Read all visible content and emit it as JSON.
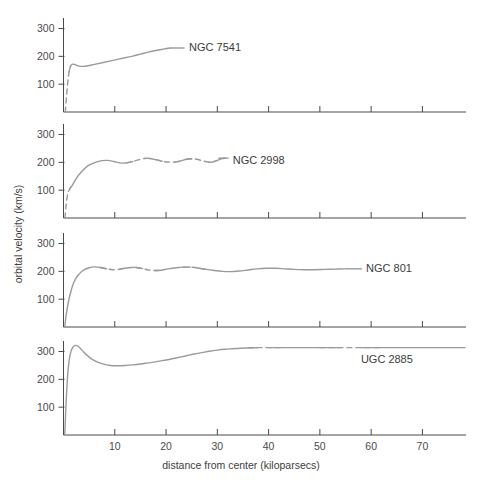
{
  "chart_data": {
    "type": "line",
    "title": "",
    "subtitle": "",
    "xlabel": "distance from center (kiloparsecs)",
    "ylabel": "orbital velocity (km/s)",
    "xlim": [
      0,
      78.5
    ],
    "ylim": [
      0,
      345
    ],
    "xticks": [
      10,
      20,
      30,
      40,
      50,
      60,
      70
    ],
    "xtick_labels": [
      "10",
      "20",
      "30",
      "40",
      "50",
      "60",
      "70"
    ],
    "yticks": [
      100,
      200,
      300
    ],
    "ytick_labels": [
      "100",
      "200",
      "300"
    ],
    "grid": false,
    "legend_position": "inline-right-of-curve",
    "panels": [
      {
        "name": "NGC 7541",
        "label": "NGC 7541",
        "label_x": 24.5,
        "label_y": 232,
        "leader_from_x": 21.0,
        "leader_to_x": 23.6,
        "points": [
          [
            0.35,
            0
          ],
          [
            0.6,
            60
          ],
          [
            0.85,
            110
          ],
          [
            1.1,
            145
          ],
          [
            1.4,
            166
          ],
          [
            1.8,
            172
          ],
          [
            2.3,
            170
          ],
          [
            3.0,
            165
          ],
          [
            3.8,
            164
          ],
          [
            4.8,
            166
          ],
          [
            6.0,
            171
          ],
          [
            7.5,
            177
          ],
          [
            9.0,
            183
          ],
          [
            10.5,
            189
          ],
          [
            12.0,
            195
          ],
          [
            13.5,
            201
          ],
          [
            15.0,
            208
          ],
          [
            16.5,
            215
          ],
          [
            18.0,
            221
          ],
          [
            19.5,
            226
          ],
          [
            20.5,
            229
          ],
          [
            21.0,
            230
          ]
        ],
        "dashed_ranges": [
          [
            0.35,
            1.35
          ]
        ]
      },
      {
        "name": "NGC 2998",
        "label": "NGC 2998",
        "label_x": 33.0,
        "label_y": 207,
        "leader_from_x": 30.2,
        "leader_to_x": 32.2,
        "points": [
          [
            0.3,
            0
          ],
          [
            0.5,
            45
          ],
          [
            0.8,
            85
          ],
          [
            1.2,
            104
          ],
          [
            1.8,
            120
          ],
          [
            2.6,
            145
          ],
          [
            3.6,
            168
          ],
          [
            4.8,
            188
          ],
          [
            6.2,
            200
          ],
          [
            7.5,
            206
          ],
          [
            8.6,
            207
          ],
          [
            9.8,
            203
          ],
          [
            11.0,
            198
          ],
          [
            12.2,
            198
          ],
          [
            13.5,
            203
          ],
          [
            14.8,
            210
          ],
          [
            15.8,
            214
          ],
          [
            16.8,
            214
          ],
          [
            18.0,
            210
          ],
          [
            19.2,
            204
          ],
          [
            20.4,
            201
          ],
          [
            21.6,
            201
          ],
          [
            22.8,
            205
          ],
          [
            24.0,
            211
          ],
          [
            25.0,
            213
          ],
          [
            26.0,
            211
          ],
          [
            27.2,
            205
          ],
          [
            28.2,
            201
          ],
          [
            29.0,
            201
          ],
          [
            30.0,
            207
          ],
          [
            30.8,
            213
          ],
          [
            31.6,
            215
          ]
        ],
        "dashed_ranges": [
          [
            0.3,
            1.3
          ],
          [
            13.3,
            16.2
          ],
          [
            18.4,
            22.2
          ],
          [
            24.6,
            28.8
          ]
        ]
      },
      {
        "name": "NGC 801",
        "label": "NGC 801",
        "label_x": 59.0,
        "label_y": 213,
        "leader_from_x": 56.0,
        "leader_to_x": 58.2,
        "points": [
          [
            0.25,
            0
          ],
          [
            0.5,
            40
          ],
          [
            0.9,
            85
          ],
          [
            1.4,
            125
          ],
          [
            2.0,
            160
          ],
          [
            2.8,
            185
          ],
          [
            3.8,
            203
          ],
          [
            5.0,
            213
          ],
          [
            6.0,
            216
          ],
          [
            7.2,
            214
          ],
          [
            8.4,
            209
          ],
          [
            9.6,
            206
          ],
          [
            10.8,
            207
          ],
          [
            12.0,
            211
          ],
          [
            13.2,
            214
          ],
          [
            14.2,
            214
          ],
          [
            15.4,
            210
          ],
          [
            16.6,
            205
          ],
          [
            17.8,
            203
          ],
          [
            19.0,
            204
          ],
          [
            20.4,
            209
          ],
          [
            22.0,
            213
          ],
          [
            23.4,
            215
          ],
          [
            24.8,
            215
          ],
          [
            26.2,
            212
          ],
          [
            27.8,
            207
          ],
          [
            29.4,
            203
          ],
          [
            31.0,
            200
          ],
          [
            32.6,
            199
          ],
          [
            34.2,
            201
          ],
          [
            36.0,
            205
          ],
          [
            37.8,
            209
          ],
          [
            39.6,
            211
          ],
          [
            41.4,
            211
          ],
          [
            43.2,
            209
          ],
          [
            45.0,
            207
          ],
          [
            47.0,
            206
          ],
          [
            49.0,
            206
          ],
          [
            51.0,
            207
          ],
          [
            53.0,
            208
          ],
          [
            55.0,
            209
          ],
          [
            56.0,
            209
          ]
        ],
        "dashed_ranges": [
          [
            8.0,
            11.0
          ],
          [
            15.0,
            18.6
          ],
          [
            24.2,
            27.2
          ]
        ]
      },
      {
        "name": "UGC 2885",
        "label": "UGC 2885",
        "label_x": 58.0,
        "label_y": 272,
        "leader_from_x": null,
        "leader_to_x": null,
        "points": [
          [
            0.25,
            0
          ],
          [
            0.4,
            70
          ],
          [
            0.6,
            150
          ],
          [
            0.9,
            235
          ],
          [
            1.3,
            290
          ],
          [
            1.8,
            315
          ],
          [
            2.3,
            322
          ],
          [
            2.9,
            318
          ],
          [
            3.6,
            305
          ],
          [
            4.5,
            288
          ],
          [
            5.6,
            272
          ],
          [
            6.8,
            261
          ],
          [
            8.0,
            254
          ],
          [
            9.2,
            250
          ],
          [
            10.5,
            249
          ],
          [
            12.0,
            250
          ],
          [
            13.5,
            252
          ],
          [
            15.0,
            255
          ],
          [
            16.5,
            259
          ],
          [
            18.0,
            263
          ],
          [
            19.5,
            268
          ],
          [
            21.0,
            273
          ],
          [
            22.5,
            279
          ],
          [
            24.0,
            285
          ],
          [
            25.5,
            291
          ],
          [
            27.0,
            296
          ],
          [
            28.5,
            301
          ],
          [
            30.0,
            305
          ],
          [
            31.5,
            308
          ],
          [
            33.0,
            310
          ],
          [
            34.5,
            312
          ],
          [
            36.0,
            313
          ],
          [
            38.0,
            314
          ],
          [
            40.0,
            314
          ],
          [
            43.0,
            314
          ],
          [
            46.0,
            314
          ],
          [
            50.0,
            314
          ],
          [
            54.0,
            314
          ],
          [
            58.0,
            314
          ],
          [
            62.0,
            314
          ],
          [
            66.0,
            314
          ],
          [
            70.0,
            314
          ],
          [
            74.0,
            314
          ],
          [
            78.3,
            314
          ]
        ],
        "dashed_ranges": [
          [
            36.2,
            40.8
          ],
          [
            52.5,
            61.0
          ]
        ]
      }
    ]
  },
  "colors": {
    "curve": "#9a9a9a",
    "axis": "#4a4a4a",
    "text": "#3c3c3c",
    "background": "#ffffff"
  }
}
